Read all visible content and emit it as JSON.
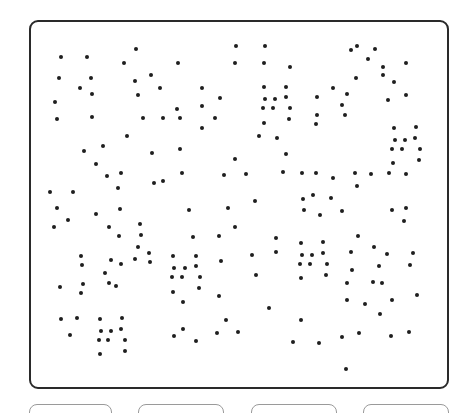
{
  "puzzle": {
    "type": "dot-count",
    "board": {
      "border_color": "#2a2a2a",
      "dot_color": "#1e1e1e"
    },
    "dots": [
      [
        61,
        57
      ],
      [
        87,
        57
      ],
      [
        136,
        49
      ],
      [
        124,
        63
      ],
      [
        178,
        63
      ],
      [
        236,
        46
      ],
      [
        235,
        63
      ],
      [
        265,
        46
      ],
      [
        264,
        63
      ],
      [
        290,
        67
      ],
      [
        351,
        50
      ],
      [
        357,
        46
      ],
      [
        375,
        49
      ],
      [
        368,
        59
      ],
      [
        383,
        67
      ],
      [
        406,
        63
      ],
      [
        383,
        75
      ],
      [
        394,
        82
      ],
      [
        356,
        78
      ],
      [
        406,
        95
      ],
      [
        388,
        100
      ],
      [
        59,
        78
      ],
      [
        80,
        88
      ],
      [
        91,
        78
      ],
      [
        92,
        94
      ],
      [
        55,
        102
      ],
      [
        57,
        119
      ],
      [
        92,
        117
      ],
      [
        135,
        81
      ],
      [
        151,
        75
      ],
      [
        138,
        95
      ],
      [
        160,
        88
      ],
      [
        143,
        118
      ],
      [
        163,
        118
      ],
      [
        177,
        109
      ],
      [
        180,
        118
      ],
      [
        202,
        88
      ],
      [
        202,
        106
      ],
      [
        220,
        98
      ],
      [
        215,
        118
      ],
      [
        202,
        128
      ],
      [
        264,
        87
      ],
      [
        286,
        87
      ],
      [
        265,
        99
      ],
      [
        275,
        99
      ],
      [
        286,
        97
      ],
      [
        263,
        108
      ],
      [
        273,
        108
      ],
      [
        290,
        108
      ],
      [
        264,
        123
      ],
      [
        289,
        119
      ],
      [
        317,
        97
      ],
      [
        333,
        88
      ],
      [
        347,
        94
      ],
      [
        342,
        105
      ],
      [
        345,
        115
      ],
      [
        317,
        115
      ],
      [
        316,
        124
      ],
      [
        127,
        136
      ],
      [
        84,
        151
      ],
      [
        103,
        146
      ],
      [
        96,
        164
      ],
      [
        107,
        176
      ],
      [
        121,
        173
      ],
      [
        118,
        188
      ],
      [
        152,
        153
      ],
      [
        180,
        149
      ],
      [
        182,
        173
      ],
      [
        154,
        183
      ],
      [
        163,
        181
      ],
      [
        259,
        136
      ],
      [
        277,
        138
      ],
      [
        286,
        154
      ],
      [
        235,
        159
      ],
      [
        224,
        175
      ],
      [
        246,
        174
      ],
      [
        283,
        172
      ],
      [
        394,
        128
      ],
      [
        416,
        127
      ],
      [
        395,
        140
      ],
      [
        405,
        140
      ],
      [
        415,
        138
      ],
      [
        392,
        149
      ],
      [
        402,
        149
      ],
      [
        420,
        149
      ],
      [
        393,
        163
      ],
      [
        419,
        160
      ],
      [
        302,
        173
      ],
      [
        316,
        173
      ],
      [
        333,
        178
      ],
      [
        355,
        173
      ],
      [
        371,
        174
      ],
      [
        389,
        173
      ],
      [
        406,
        174
      ],
      [
        357,
        186
      ],
      [
        50,
        192
      ],
      [
        73,
        192
      ],
      [
        57,
        208
      ],
      [
        68,
        220
      ],
      [
        54,
        227
      ],
      [
        96,
        214
      ],
      [
        120,
        209
      ],
      [
        109,
        227
      ],
      [
        119,
        236
      ],
      [
        140,
        224
      ],
      [
        141,
        235
      ],
      [
        138,
        247
      ],
      [
        149,
        253
      ],
      [
        135,
        259
      ],
      [
        150,
        262
      ],
      [
        189,
        210
      ],
      [
        228,
        208
      ],
      [
        255,
        201
      ],
      [
        235,
        227
      ],
      [
        303,
        199
      ],
      [
        313,
        195
      ],
      [
        331,
        198
      ],
      [
        304,
        210
      ],
      [
        320,
        215
      ],
      [
        342,
        211
      ],
      [
        392,
        210
      ],
      [
        406,
        208
      ],
      [
        404,
        221
      ],
      [
        193,
        237
      ],
      [
        219,
        236
      ],
      [
        276,
        238
      ],
      [
        276,
        252
      ],
      [
        252,
        255
      ],
      [
        221,
        261
      ],
      [
        256,
        275
      ],
      [
        81,
        256
      ],
      [
        82,
        265
      ],
      [
        111,
        260
      ],
      [
        121,
        264
      ],
      [
        105,
        273
      ],
      [
        109,
        283
      ],
      [
        116,
        286
      ],
      [
        60,
        287
      ],
      [
        83,
        284
      ],
      [
        81,
        293
      ],
      [
        173,
        256
      ],
      [
        196,
        256
      ],
      [
        174,
        268
      ],
      [
        185,
        268
      ],
      [
        196,
        266
      ],
      [
        172,
        277
      ],
      [
        182,
        277
      ],
      [
        200,
        277
      ],
      [
        173,
        292
      ],
      [
        199,
        288
      ],
      [
        183,
        302
      ],
      [
        301,
        243
      ],
      [
        323,
        242
      ],
      [
        302,
        255
      ],
      [
        312,
        255
      ],
      [
        323,
        253
      ],
      [
        300,
        264
      ],
      [
        310,
        264
      ],
      [
        327,
        264
      ],
      [
        301,
        278
      ],
      [
        326,
        275
      ],
      [
        358,
        236
      ],
      [
        351,
        252
      ],
      [
        374,
        247
      ],
      [
        387,
        254
      ],
      [
        413,
        253
      ],
      [
        352,
        270
      ],
      [
        379,
        266
      ],
      [
        410,
        265
      ],
      [
        347,
        283
      ],
      [
        373,
        282
      ],
      [
        382,
        283
      ],
      [
        347,
        300
      ],
      [
        365,
        304
      ],
      [
        380,
        314
      ],
      [
        392,
        300
      ],
      [
        417,
        295
      ],
      [
        219,
        296
      ],
      [
        269,
        308
      ],
      [
        301,
        320
      ],
      [
        61,
        319
      ],
      [
        77,
        318
      ],
      [
        70,
        335
      ],
      [
        100,
        319
      ],
      [
        122,
        318
      ],
      [
        101,
        331
      ],
      [
        111,
        331
      ],
      [
        121,
        329
      ],
      [
        99,
        340
      ],
      [
        108,
        340
      ],
      [
        125,
        340
      ],
      [
        100,
        354
      ],
      [
        125,
        351
      ],
      [
        174,
        336
      ],
      [
        183,
        329
      ],
      [
        196,
        341
      ],
      [
        217,
        333
      ],
      [
        226,
        320
      ],
      [
        238,
        332
      ],
      [
        293,
        342
      ],
      [
        319,
        343
      ],
      [
        342,
        337
      ],
      [
        359,
        333
      ],
      [
        391,
        336
      ],
      [
        409,
        332
      ],
      [
        346,
        369
      ]
    ]
  },
  "answers": {
    "buttons": [
      {
        "label": "",
        "left": 29,
        "width": 83
      },
      {
        "label": "",
        "left": 138,
        "width": 86
      },
      {
        "label": "",
        "left": 251,
        "width": 86
      },
      {
        "label": "",
        "left": 363,
        "width": 86
      }
    ]
  }
}
